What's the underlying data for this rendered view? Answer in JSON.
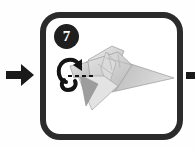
{
  "diagram": {
    "kind": "origami-instruction-step",
    "step_number": "7",
    "panel": {
      "border_color": "#2b2b2b",
      "background_color": "#ffffff"
    },
    "badge": {
      "label": "7",
      "background_color": "#1f1f1f",
      "text_color": "#ffffff"
    },
    "model": {
      "name": "folded paper bird",
      "fill_light": "#e8e8e8",
      "fill_mid": "#cfcfcf",
      "fill_dark": "#a8a8a8",
      "fill_deep": "#8e8e8e",
      "outline_color": "#9a9a9a"
    },
    "fold_marks": {
      "rotate_arrow_name": "curved rotation arrow",
      "rotate_arrow_color": "#141414",
      "dashed_line_name": "valley fold dashed line",
      "dashed_line_color": "#141414"
    },
    "flow_arrows": [
      {
        "name": "incoming-step-arrow",
        "direction": "right",
        "color": "#1a1a1a"
      },
      {
        "name": "outgoing-step-arrow",
        "direction": "right",
        "color": "#1a1a1a"
      }
    ]
  }
}
